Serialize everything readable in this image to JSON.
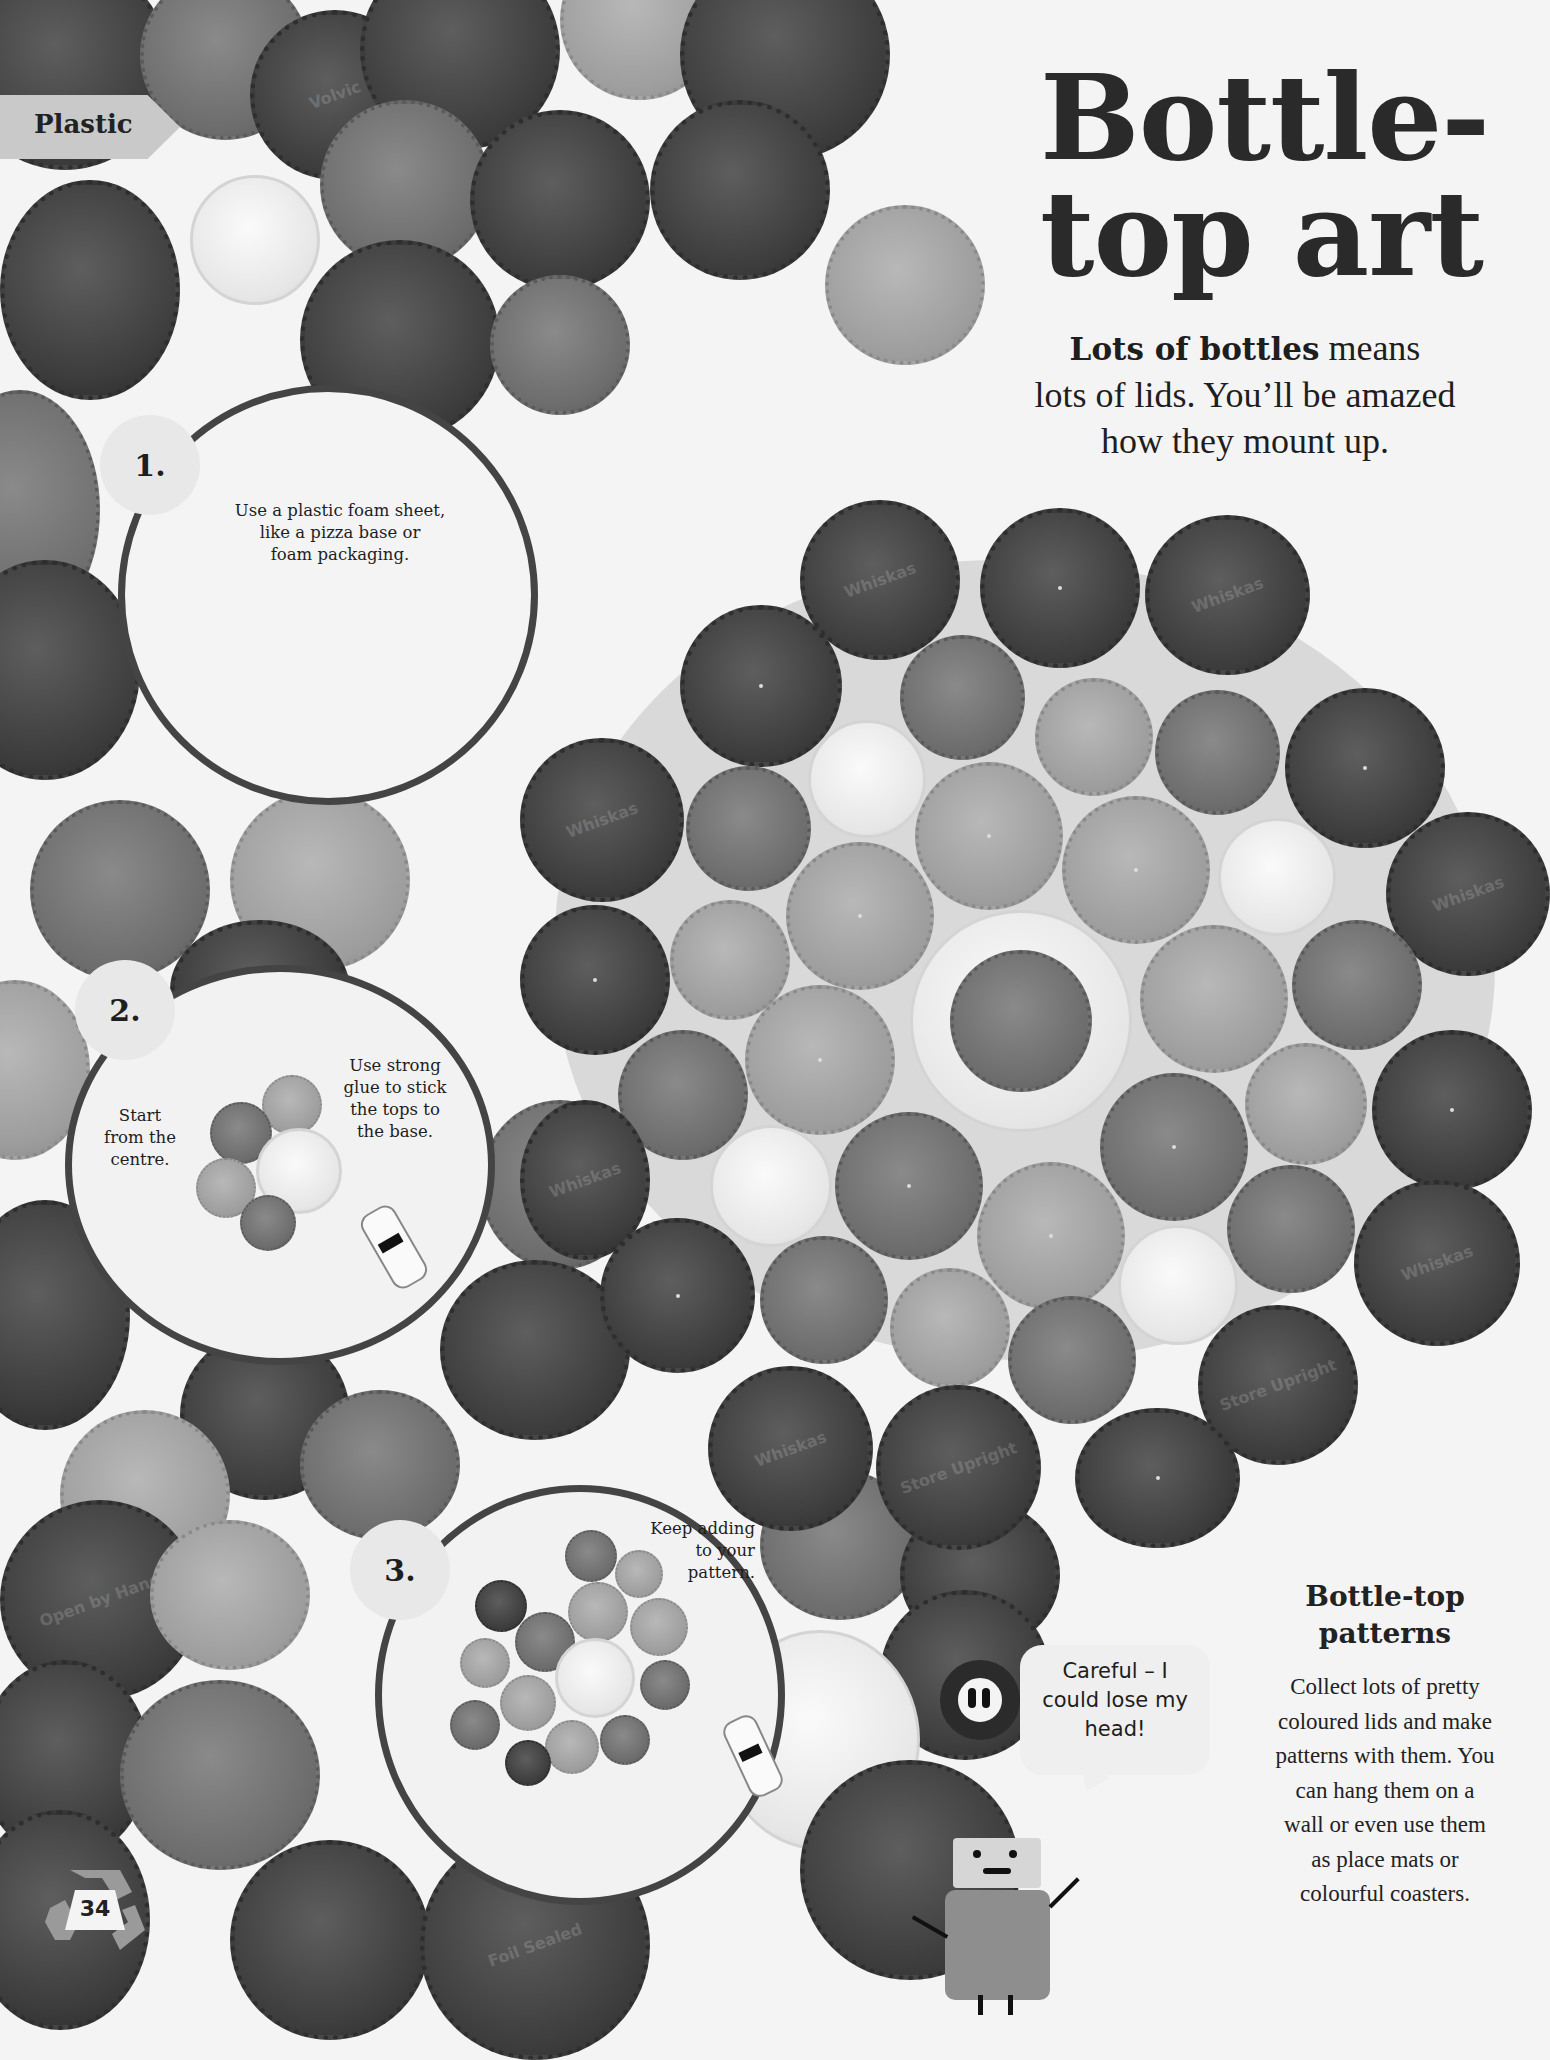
{
  "section_tab": {
    "label": "Plastic"
  },
  "title": {
    "line1": "Bottle-",
    "line2": "top art"
  },
  "intro": {
    "bold": "Lots of bottles",
    "rest_line1": " means",
    "line2": "lots of lids. You’ll be amazed",
    "line3": "how they mount up."
  },
  "steps": [
    {
      "number": "1.",
      "text_lines": [
        "Use a plastic foam sheet,",
        "like a pizza base or",
        "foam packaging."
      ]
    },
    {
      "number": "2.",
      "left_text_lines": [
        "Start",
        "from the",
        "centre."
      ],
      "right_text_lines": [
        "Use strong",
        "glue to stick",
        "the tops to",
        "the base."
      ]
    },
    {
      "number": "3.",
      "text_lines": [
        "Keep adding",
        "to your",
        "pattern."
      ]
    }
  ],
  "sidebar": {
    "heading_lines": [
      "Bottle-top",
      "patterns"
    ],
    "body_lines": [
      "Collect lots of pretty",
      "coloured lids and make",
      "patterns with them. You",
      "can hang them on a",
      "wall or even use them",
      "as place mats or",
      "colourful coasters."
    ]
  },
  "speech_bubble": {
    "lines": [
      "Careful – I",
      "could lose my",
      "head!"
    ]
  },
  "page_number": "34",
  "cap_brands": [
    "Whiskas",
    "Volvic",
    "Store Upright",
    "Foil Sealed",
    "Open by Hand"
  ],
  "colors": {
    "tab": "#c9c9c9",
    "circle_border": "#444444",
    "text": "#1e1e1e",
    "paper": "#f4f4f4"
  }
}
